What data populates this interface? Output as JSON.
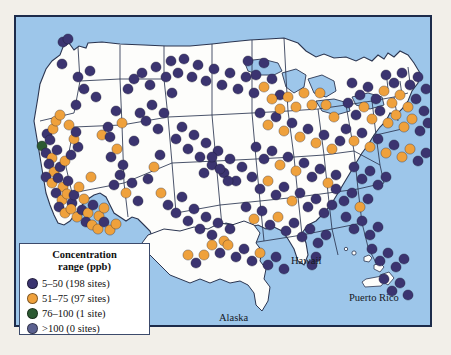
{
  "figure": {
    "type": "choropleth-point-map",
    "region": "United States (with Alaska, Hawaii, Puerto Rico insets)"
  },
  "legend": {
    "title_line1": "Concentration",
    "title_line2": "range (ppb)",
    "entries": [
      {
        "label": "5–50 (198 sites)",
        "range": "5–50",
        "sites": 198,
        "color": "#3b3470"
      },
      {
        "label": "51–75 (97 sites)",
        "range": "51–75",
        "sites": 97,
        "color": "#efa13c"
      },
      {
        "label": "76–100 (1 site)",
        "range": "76–100",
        "sites": 1,
        "color": "#2c5a32"
      },
      {
        "label": ">100 (0 sites)",
        "range": ">100",
        "sites": 0,
        "color": "#5b6190"
      }
    ]
  },
  "inset_labels": {
    "hawaii": "Hawaii",
    "puerto_rico": "Puerto Rico",
    "alaska": "Alaska"
  },
  "colors": {
    "ocean": "#9dc6ea",
    "land": "#fdfdfb",
    "frame": "#1d2b4a",
    "state_border": "#2b3550",
    "page_background": "#f2efe9"
  },
  "chart_data": {
    "type": "scatter",
    "title": "",
    "xlabel": "",
    "ylabel": "",
    "categories": [
      "5–50",
      "51–75",
      "76–100",
      ">100"
    ],
    "values": [
      198,
      97,
      1,
      0
    ],
    "series": [
      {
        "name": "5–50 (198 sites)",
        "color": "#3b3470",
        "count": 198
      },
      {
        "name": "51–75 (97 sites)",
        "color": "#efa13c",
        "count": 97
      },
      {
        "name": "76–100 (1 site)",
        "color": "#2c5a32",
        "count": 1
      },
      {
        "name": ">100 (0 sites)",
        "color": "#5b6190",
        "count": 0
      }
    ],
    "legend_position": "bottom-left",
    "grid": false,
    "points": [
      [
        47,
        25,
        0
      ],
      [
        52,
        22,
        0
      ],
      [
        46,
        47,
        0
      ],
      [
        60,
        88,
        0
      ],
      [
        26,
        129,
        2
      ],
      [
        31,
        117,
        0
      ],
      [
        37,
        112,
        1
      ],
      [
        40,
        104,
        1
      ],
      [
        44,
        98,
        1
      ],
      [
        34,
        123,
        0
      ],
      [
        30,
        136,
        0
      ],
      [
        36,
        141,
        1
      ],
      [
        41,
        133,
        0
      ],
      [
        33,
        147,
        0
      ],
      [
        38,
        155,
        1
      ],
      [
        44,
        150,
        0
      ],
      [
        30,
        160,
        0
      ],
      [
        36,
        166,
        1
      ],
      [
        42,
        161,
        0
      ],
      [
        47,
        170,
        1
      ],
      [
        52,
        164,
        0
      ],
      [
        40,
        176,
        0
      ],
      [
        46,
        183,
        1
      ],
      [
        51,
        177,
        1
      ],
      [
        56,
        186,
        0
      ],
      [
        43,
        190,
        0
      ],
      [
        49,
        196,
        1
      ],
      [
        55,
        192,
        1
      ],
      [
        61,
        200,
        1
      ],
      [
        66,
        193,
        0
      ],
      [
        58,
        178,
        0
      ],
      [
        63,
        170,
        1
      ],
      [
        68,
        182,
        1
      ],
      [
        72,
        196,
        1
      ],
      [
        77,
        188,
        0
      ],
      [
        83,
        199,
        1
      ],
      [
        88,
        191,
        1
      ],
      [
        70,
        205,
        0
      ],
      [
        76,
        208,
        1
      ],
      [
        82,
        212,
        1
      ],
      [
        88,
        205,
        0
      ],
      [
        94,
        213,
        1
      ],
      [
        100,
        207,
        1
      ],
      [
        49,
        144,
        1
      ],
      [
        55,
        138,
        0
      ],
      [
        62,
        130,
        0
      ],
      [
        58,
        122,
        1
      ],
      [
        53,
        108,
        1
      ],
      [
        60,
        115,
        0
      ],
      [
        80,
        80,
        0
      ],
      [
        86,
        118,
        1
      ],
      [
        92,
        110,
        0
      ],
      [
        75,
        160,
        1
      ],
      [
        98,
        168,
        0
      ],
      [
        104,
        158,
        0
      ],
      [
        110,
        176,
        1
      ],
      [
        116,
        166,
        0
      ],
      [
        122,
        184,
        0
      ],
      [
        95,
        140,
        0
      ],
      [
        101,
        132,
        1
      ],
      [
        107,
        148,
        0
      ],
      [
        118,
        124,
        0
      ],
      [
        124,
        96,
        0
      ],
      [
        130,
        104,
        0
      ],
      [
        136,
        88,
        0
      ],
      [
        142,
        112,
        0
      ],
      [
        148,
        96,
        0
      ],
      [
        112,
        72,
        0
      ],
      [
        118,
        62,
        0
      ],
      [
        126,
        56,
        0
      ],
      [
        134,
        68,
        0
      ],
      [
        140,
        50,
        0
      ],
      [
        150,
        60,
        0
      ],
      [
        156,
        76,
        0
      ],
      [
        145,
        176,
        1
      ],
      [
        152,
        188,
        0
      ],
      [
        160,
        196,
        0
      ],
      [
        166,
        180,
        0
      ],
      [
        172,
        204,
        0
      ],
      [
        178,
        192,
        0
      ],
      [
        184,
        212,
        0
      ],
      [
        190,
        200,
        0
      ],
      [
        196,
        218,
        0
      ],
      [
        202,
        206,
        0
      ],
      [
        208,
        224,
        1
      ],
      [
        214,
        212,
        0
      ],
      [
        160,
        122,
        0
      ],
      [
        166,
        110,
        0
      ],
      [
        172,
        132,
        0
      ],
      [
        178,
        118,
        0
      ],
      [
        184,
        140,
        0
      ],
      [
        190,
        126,
        0
      ],
      [
        196,
        148,
        0
      ],
      [
        202,
        134,
        0
      ],
      [
        208,
        156,
        0
      ],
      [
        214,
        142,
        0
      ],
      [
        220,
        164,
        0
      ],
      [
        226,
        150,
        0
      ],
      [
        155,
        44,
        0
      ],
      [
        162,
        56,
        0
      ],
      [
        168,
        42,
        0
      ],
      [
        176,
        60,
        0
      ],
      [
        182,
        48,
        0
      ],
      [
        190,
        64,
        0
      ],
      [
        198,
        52,
        0
      ],
      [
        206,
        68,
        0
      ],
      [
        214,
        56,
        0
      ],
      [
        222,
        72,
        0
      ],
      [
        230,
        60,
        0
      ],
      [
        238,
        76,
        0
      ],
      [
        232,
        44,
        0
      ],
      [
        240,
        58,
        0
      ],
      [
        248,
        70,
        1
      ],
      [
        256,
        62,
        0
      ],
      [
        264,
        78,
        0
      ],
      [
        248,
        46,
        0
      ],
      [
        244,
        96,
        0
      ],
      [
        252,
        108,
        1
      ],
      [
        260,
        100,
        0
      ],
      [
        268,
        114,
        1
      ],
      [
        276,
        106,
        0
      ],
      [
        284,
        120,
        1
      ],
      [
        292,
        112,
        0
      ],
      [
        300,
        126,
        1
      ],
      [
        308,
        118,
        0
      ],
      [
        316,
        132,
        1
      ],
      [
        324,
        124,
        0
      ],
      [
        240,
        130,
        0
      ],
      [
        248,
        142,
        0
      ],
      [
        256,
        134,
        0
      ],
      [
        264,
        148,
        1
      ],
      [
        272,
        140,
        0
      ],
      [
        280,
        154,
        1
      ],
      [
        288,
        146,
        0
      ],
      [
        296,
        160,
        0
      ],
      [
        304,
        152,
        0
      ],
      [
        312,
        166,
        1
      ],
      [
        320,
        158,
        0
      ],
      [
        236,
        160,
        0
      ],
      [
        244,
        172,
        0
      ],
      [
        252,
        164,
        1
      ],
      [
        260,
        178,
        0
      ],
      [
        268,
        170,
        0
      ],
      [
        276,
        184,
        1
      ],
      [
        284,
        176,
        0
      ],
      [
        292,
        190,
        0
      ],
      [
        300,
        182,
        0
      ],
      [
        308,
        196,
        0
      ],
      [
        316,
        188,
        0
      ],
      [
        230,
        190,
        0
      ],
      [
        238,
        202,
        1
      ],
      [
        246,
        194,
        0
      ],
      [
        254,
        208,
        0
      ],
      [
        262,
        200,
        1
      ],
      [
        270,
        214,
        0
      ],
      [
        278,
        206,
        0
      ],
      [
        286,
        220,
        0
      ],
      [
        294,
        212,
        0
      ],
      [
        302,
        226,
        0
      ],
      [
        310,
        218,
        0
      ],
      [
        196,
        228,
        1
      ],
      [
        204,
        236,
        0
      ],
      [
        212,
        228,
        1
      ],
      [
        220,
        240,
        0
      ],
      [
        228,
        232,
        0
      ],
      [
        236,
        244,
        0
      ],
      [
        244,
        236,
        1
      ],
      [
        252,
        248,
        0
      ],
      [
        260,
        240,
        0
      ],
      [
        268,
        252,
        0
      ],
      [
        330,
        112,
        0
      ],
      [
        338,
        124,
        1
      ],
      [
        346,
        116,
        0
      ],
      [
        354,
        130,
        1
      ],
      [
        362,
        122,
        0
      ],
      [
        370,
        136,
        1
      ],
      [
        378,
        128,
        0
      ],
      [
        386,
        140,
        1
      ],
      [
        394,
        132,
        1
      ],
      [
        402,
        144,
        0
      ],
      [
        410,
        136,
        0
      ],
      [
        332,
        86,
        0
      ],
      [
        340,
        98,
        0
      ],
      [
        348,
        90,
        1
      ],
      [
        356,
        102,
        1
      ],
      [
        364,
        94,
        0
      ],
      [
        372,
        106,
        1
      ],
      [
        380,
        98,
        1
      ],
      [
        388,
        110,
        1
      ],
      [
        396,
        102,
        1
      ],
      [
        404,
        114,
        0
      ],
      [
        412,
        106,
        0
      ],
      [
        336,
        66,
        0
      ],
      [
        344,
        78,
        0
      ],
      [
        352,
        70,
        0
      ],
      [
        360,
        82,
        0
      ],
      [
        368,
        74,
        1
      ],
      [
        376,
        86,
        1
      ],
      [
        384,
        78,
        1
      ],
      [
        392,
        90,
        1
      ],
      [
        400,
        82,
        0
      ],
      [
        408,
        94,
        0
      ],
      [
        370,
        58,
        0
      ],
      [
        378,
        66,
        0
      ],
      [
        386,
        56,
        0
      ],
      [
        394,
        68,
        0
      ],
      [
        402,
        60,
        0
      ],
      [
        410,
        72,
        0
      ],
      [
        338,
        150,
        0
      ],
      [
        346,
        162,
        0
      ],
      [
        354,
        154,
        0
      ],
      [
        362,
        168,
        0
      ],
      [
        370,
        160,
        0
      ],
      [
        320,
        172,
        0
      ],
      [
        328,
        184,
        0
      ],
      [
        336,
        176,
        0
      ],
      [
        344,
        190,
        1
      ],
      [
        352,
        182,
        0
      ],
      [
        330,
        200,
        0
      ],
      [
        338,
        212,
        0
      ],
      [
        346,
        204,
        0
      ],
      [
        354,
        218,
        0
      ],
      [
        362,
        210,
        0
      ],
      [
        356,
        232,
        0
      ],
      [
        364,
        244,
        0
      ],
      [
        372,
        236,
        0
      ],
      [
        380,
        250,
        0
      ],
      [
        388,
        242,
        0
      ],
      [
        368,
        262,
        0
      ],
      [
        376,
        274,
        0
      ],
      [
        384,
        266,
        0
      ],
      [
        392,
        278,
        0
      ],
      [
        300,
        240,
        0
      ],
      [
        296,
        248,
        0
      ],
      [
        310,
        88,
        1
      ],
      [
        318,
        100,
        1
      ],
      [
        304,
        76,
        1
      ],
      [
        296,
        88,
        1
      ],
      [
        288,
        76,
        1
      ],
      [
        280,
        90,
        1
      ],
      [
        272,
        80,
        1
      ],
      [
        264,
        92,
        1
      ],
      [
        256,
        82,
        1
      ],
      [
        204,
        152,
        0
      ],
      [
        212,
        164,
        0
      ],
      [
        196,
        140,
        0
      ],
      [
        188,
        156,
        0
      ],
      [
        172,
        238,
        1
      ],
      [
        180,
        246,
        0
      ],
      [
        188,
        238,
        1
      ],
      [
        144,
        138,
        0
      ],
      [
        138,
        150,
        1
      ],
      [
        132,
        162,
        0
      ],
      [
        100,
        94,
        0
      ],
      [
        106,
        106,
        1
      ],
      [
        94,
        120,
        0
      ],
      [
        62,
        60,
        0
      ],
      [
        68,
        72,
        0
      ],
      [
        74,
        54,
        0
      ]
    ],
    "point_class_index_legend": "third element of each point = index into series[] (0=5-50 navy, 1=51-75 orange, 2=76-100 green, 3=>100 slate)"
  }
}
